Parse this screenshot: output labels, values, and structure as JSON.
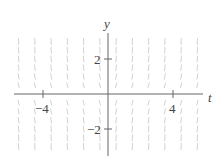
{
  "chart_data": {
    "type": "slope_field",
    "title": "",
    "xlabel": "t",
    "ylabel": "y",
    "xlim": [
      -6,
      6
    ],
    "ylim": [
      -3.5,
      3.5
    ],
    "xticks": [
      -4,
      4
    ],
    "xtick_labels": [
      "−4",
      "4"
    ],
    "yticks": [
      2,
      -2
    ],
    "ytick_labels": [
      "2",
      "−2"
    ],
    "grid": false,
    "field": {
      "t_values": [
        -5.5,
        -4.5,
        -3.5,
        -2.5,
        -1.5,
        -0.5,
        0.5,
        1.5,
        2.5,
        3.5,
        4.5,
        5.5
      ],
      "y_values": [
        3,
        2.5,
        2,
        1.5,
        1,
        0.5,
        -0.5,
        -1,
        -1.5,
        -2,
        -2.5,
        -3
      ],
      "description": "short, mostly steep (near-vertical) slope segments in faint gray"
    }
  },
  "labels": {
    "y_axis": "y",
    "t_axis": "t",
    "tick_neg4": "−4",
    "tick_4": "4",
    "tick_2": "2",
    "tick_neg2": "−2"
  }
}
